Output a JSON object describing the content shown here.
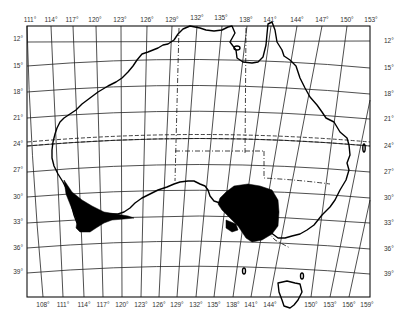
{
  "map": {
    "title": "",
    "region": "Australia",
    "frame": {
      "left": 27,
      "right": 370,
      "top": 26,
      "bottom": 297
    },
    "colors": {
      "background": "#ffffff",
      "lines": "#111111",
      "shaded_area": "#000000",
      "labels": "#333333"
    },
    "top_longitude_labels": [
      {
        "label": "111°",
        "x": 30
      },
      {
        "label": "114°",
        "x": 51
      },
      {
        "label": "117°",
        "x": 72
      },
      {
        "label": "120°",
        "x": 95
      },
      {
        "label": "123°",
        "x": 120
      },
      {
        "label": "126°",
        "x": 147
      },
      {
        "label": "129°",
        "x": 172
      },
      {
        "label": "132°",
        "x": 197
      },
      {
        "label": "135°",
        "x": 221
      },
      {
        "label": "138°",
        "x": 246
      },
      {
        "label": "141°",
        "x": 270
      },
      {
        "label": "144°",
        "x": 297
      },
      {
        "label": "147°",
        "x": 322
      },
      {
        "label": "150°",
        "x": 347
      },
      {
        "label": "153°",
        "x": 371
      }
    ],
    "bottom_longitude_labels": [
      {
        "label": "108°",
        "x": 43
      },
      {
        "label": "111°",
        "x": 63
      },
      {
        "label": "114°",
        "x": 84
      },
      {
        "label": "117°",
        "x": 103
      },
      {
        "label": "120°",
        "x": 122
      },
      {
        "label": "123°",
        "x": 141
      },
      {
        "label": "126°",
        "x": 159
      },
      {
        "label": "129°",
        "x": 177
      },
      {
        "label": "132°",
        "x": 196
      },
      {
        "label": "135°",
        "x": 214
      },
      {
        "label": "138°",
        "x": 233
      },
      {
        "label": "141°",
        "x": 251
      },
      {
        "label": "144°",
        "x": 270
      },
      {
        "label": "150°",
        "x": 311
      },
      {
        "label": "153°",
        "x": 330
      },
      {
        "label": "156°",
        "x": 349
      },
      {
        "label": "159°",
        "x": 367
      }
    ],
    "left_latitude_labels": [
      {
        "label": "12°",
        "y": 39
      },
      {
        "label": "15°",
        "y": 66
      },
      {
        "label": "18°",
        "y": 92
      },
      {
        "label": "21°",
        "y": 118
      },
      {
        "label": "24°",
        "y": 144
      },
      {
        "label": "27°",
        "y": 170
      },
      {
        "label": "30°",
        "y": 197
      },
      {
        "label": "33°",
        "y": 222
      },
      {
        "label": "36°",
        "y": 248
      },
      {
        "label": "39°",
        "y": 272
      }
    ],
    "right_latitude_labels": [
      {
        "label": "12°",
        "y": 41
      },
      {
        "label": "15°",
        "y": 68
      },
      {
        "label": "18°",
        "y": 94
      },
      {
        "label": "21°",
        "y": 119
      },
      {
        "label": "24°",
        "y": 146
      },
      {
        "label": "27°",
        "y": 172
      },
      {
        "label": "30°",
        "y": 198
      },
      {
        "label": "33°",
        "y": 223
      },
      {
        "label": "36°",
        "y": 249
      },
      {
        "label": "39°",
        "y": 274
      }
    ],
    "features": {
      "tropic_line": "Tropic of Capricorn (dashed)",
      "state_borders": "dash-dot lines",
      "shaded_regions": [
        "south-west Western Australia",
        "south-east South Australia / western Victoria"
      ],
      "islands": [
        "Tasmania",
        "Kangaroo Island"
      ]
    }
  }
}
